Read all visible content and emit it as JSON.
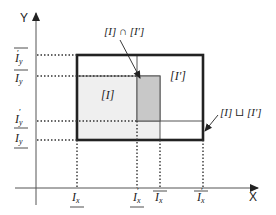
{
  "diagram": {
    "type": "interval-box-diagram",
    "axes": {
      "x_label": "X",
      "y_label": "Y"
    },
    "regions": {
      "I": {
        "label": "[I]",
        "fill": "#efefef"
      },
      "I_prime": {
        "label": "[I′]",
        "fill": "#ffffff"
      },
      "intersection": {
        "label": "[I] ∩ [I′]",
        "fill": "#c8c8c8"
      },
      "hull": {
        "label": "[I] ⊔ [I′]",
        "stroke": "#222222"
      }
    },
    "y_ticks": [
      {
        "id": "Ipy_upper",
        "text": "I′y",
        "decoration": "overline"
      },
      {
        "id": "Iy_upper",
        "text": "Iy",
        "decoration": "overline"
      },
      {
        "id": "Ipy_lower",
        "text": "I′y",
        "decoration": "underline"
      },
      {
        "id": "Iy_lower",
        "text": "Iy",
        "decoration": "underline"
      }
    ],
    "x_ticks": [
      {
        "id": "Ix_lower",
        "text": "Ix",
        "decoration": "underline"
      },
      {
        "id": "Ipx_lower",
        "text": "I′x",
        "decoration": "underline"
      },
      {
        "id": "Ix_upper",
        "text": "Ix",
        "decoration": "overline"
      },
      {
        "id": "Ipx_upper",
        "text": "I′x",
        "decoration": "overline"
      }
    ],
    "colors": {
      "line": "#222222",
      "I_fill": "#efefef",
      "intersection_fill": "#c8c8c8"
    }
  }
}
